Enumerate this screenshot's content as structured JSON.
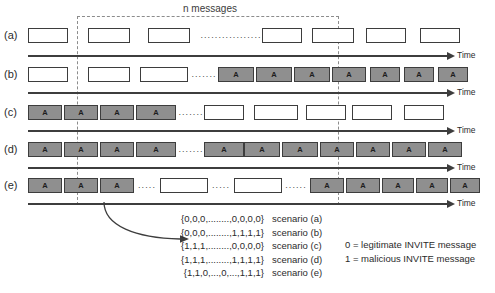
{
  "figure": {
    "window_label": "n messages",
    "axis_label": "Time"
  },
  "rows": [
    {
      "id": "a",
      "label": "(a)",
      "messages": [
        {
          "kind": "legit",
          "text": ""
        },
        {
          "kind": "legit",
          "text": ""
        },
        {
          "kind": "legit",
          "text": ""
        },
        {
          "kind": "ellipsis",
          "text": "................."
        },
        {
          "kind": "legit",
          "text": ""
        },
        {
          "kind": "legit",
          "text": ""
        },
        {
          "kind": "legit",
          "text": ""
        },
        {
          "kind": "legit",
          "text": ""
        }
      ]
    },
    {
      "id": "b",
      "label": "(b)",
      "messages": [
        {
          "kind": "legit",
          "text": ""
        },
        {
          "kind": "legit",
          "text": ""
        },
        {
          "kind": "legit",
          "text": ""
        },
        {
          "kind": "ellipsis",
          "text": "......."
        },
        {
          "kind": "mal",
          "text": "A"
        },
        {
          "kind": "mal",
          "text": "A"
        },
        {
          "kind": "mal",
          "text": "A"
        },
        {
          "kind": "mal",
          "text": "A"
        },
        {
          "kind": "mal",
          "text": "A"
        },
        {
          "kind": "mal",
          "text": "A"
        },
        {
          "kind": "mal",
          "text": "A"
        }
      ]
    },
    {
      "id": "c",
      "label": "(c)",
      "messages": [
        {
          "kind": "mal",
          "text": "A"
        },
        {
          "kind": "mal",
          "text": "A"
        },
        {
          "kind": "mal",
          "text": "A"
        },
        {
          "kind": "mal",
          "text": "A"
        },
        {
          "kind": "ellipsis",
          "text": "......."
        },
        {
          "kind": "legit",
          "text": ""
        },
        {
          "kind": "legit",
          "text": ""
        },
        {
          "kind": "legit",
          "text": ""
        },
        {
          "kind": "legit",
          "text": ""
        },
        {
          "kind": "legit",
          "text": ""
        }
      ]
    },
    {
      "id": "d",
      "label": "(d)",
      "messages": [
        {
          "kind": "mal",
          "text": "A"
        },
        {
          "kind": "mal",
          "text": "A"
        },
        {
          "kind": "mal",
          "text": "A"
        },
        {
          "kind": "mal",
          "text": "A"
        },
        {
          "kind": "ellipsis",
          "text": "......."
        },
        {
          "kind": "mal",
          "text": "A"
        },
        {
          "kind": "mal",
          "text": "A"
        },
        {
          "kind": "mal",
          "text": "A"
        },
        {
          "kind": "mal",
          "text": "A"
        },
        {
          "kind": "mal",
          "text": "A"
        },
        {
          "kind": "mal",
          "text": "A"
        },
        {
          "kind": "mal",
          "text": "A"
        }
      ]
    },
    {
      "id": "e",
      "label": "(e)",
      "messages": [
        {
          "kind": "mal",
          "text": "A"
        },
        {
          "kind": "mal",
          "text": "A"
        },
        {
          "kind": "mal",
          "text": "A"
        },
        {
          "kind": "ellipsis",
          "text": "....."
        },
        {
          "kind": "legit",
          "text": ""
        },
        {
          "kind": "ellipsis",
          "text": "....."
        },
        {
          "kind": "legit",
          "text": ""
        },
        {
          "kind": "ellipsis",
          "text": "......"
        },
        {
          "kind": "mal",
          "text": "A"
        },
        {
          "kind": "mal",
          "text": "A"
        },
        {
          "kind": "mal",
          "text": "A"
        },
        {
          "kind": "mal",
          "text": "A"
        },
        {
          "kind": "mal",
          "text": "A"
        }
      ]
    }
  ],
  "scenarios": [
    {
      "vector": "{0,0,0,........,0,0,0,0}",
      "name": "scenario (a)"
    },
    {
      "vector": "{0,0,0,........,1,1,1,1}",
      "name": "scenario (b)"
    },
    {
      "vector": "{1,1,1,........,0,0,0,0}",
      "name": "scenario (c)"
    },
    {
      "vector": "{1,1,1,........,1,1,1,1}",
      "name": "scenario (d)"
    },
    {
      "vector": "{1,1,0,...,0,...,1,1,1}",
      "name": "scenario (e)"
    }
  ],
  "key": [
    "0 = legitimate INVITE message",
    "1 = malicious INVITE message"
  ]
}
